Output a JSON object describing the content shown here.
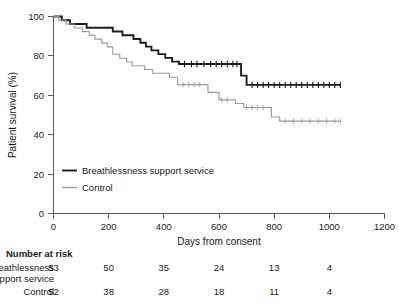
{
  "chart_data": {
    "type": "line",
    "title": "",
    "xlabel": "Days from consent",
    "ylabel": "Patient survival (%)",
    "xlim": [
      0,
      1200
    ],
    "ylim": [
      0,
      100
    ],
    "xticks": [
      0,
      200,
      400,
      600,
      800,
      1000,
      1200
    ],
    "yticks": [
      0,
      20,
      40,
      60,
      80,
      100
    ],
    "grid": false,
    "legend_position": "lower-left-inside",
    "series": [
      {
        "name": "Breathlessness support service",
        "color": "#1c1c1c",
        "style": "step",
        "points": [
          [
            0,
            100
          ],
          [
            30,
            100
          ],
          [
            30,
            98.1
          ],
          [
            60,
            98.1
          ],
          [
            60,
            96.2
          ],
          [
            120,
            96.2
          ],
          [
            120,
            94.3
          ],
          [
            185,
            94.3
          ],
          [
            185,
            94.3
          ],
          [
            215,
            94.3
          ],
          [
            215,
            92.4
          ],
          [
            250,
            92.4
          ],
          [
            250,
            90.5
          ],
          [
            290,
            90.5
          ],
          [
            290,
            88.6
          ],
          [
            315,
            88.6
          ],
          [
            315,
            86.7
          ],
          [
            335,
            86.7
          ],
          [
            335,
            84.7
          ],
          [
            355,
            84.7
          ],
          [
            355,
            82.8
          ],
          [
            380,
            82.8
          ],
          [
            380,
            80.9
          ],
          [
            405,
            80.9
          ],
          [
            405,
            79.0
          ],
          [
            430,
            79.0
          ],
          [
            430,
            77.1
          ],
          [
            455,
            77.1
          ],
          [
            455,
            75.9
          ],
          [
            680,
            75.9
          ],
          [
            680,
            70.0
          ],
          [
            700,
            70.0
          ],
          [
            700,
            65.3
          ],
          [
            1040,
            65.3
          ]
        ],
        "censor_times": [
          475,
          500,
          520,
          545,
          570,
          590,
          610,
          630,
          650,
          665,
          720,
          740,
          760,
          780,
          800,
          820,
          840,
          860,
          880,
          900,
          920,
          940,
          960,
          980,
          1000,
          1020,
          1040
        ]
      },
      {
        "name": "Control",
        "color": "#9a9a9a",
        "style": "step",
        "points": [
          [
            0,
            100
          ],
          [
            20,
            100
          ],
          [
            20,
            98.1
          ],
          [
            45,
            98.1
          ],
          [
            45,
            96.2
          ],
          [
            75,
            96.2
          ],
          [
            75,
            94.2
          ],
          [
            105,
            94.2
          ],
          [
            105,
            92.3
          ],
          [
            130,
            92.3
          ],
          [
            130,
            90.4
          ],
          [
            150,
            90.4
          ],
          [
            150,
            88.5
          ],
          [
            175,
            88.5
          ],
          [
            175,
            86.5
          ],
          [
            195,
            86.5
          ],
          [
            195,
            84.6
          ],
          [
            215,
            84.6
          ],
          [
            215,
            80.8
          ],
          [
            240,
            80.8
          ],
          [
            240,
            78.8
          ],
          [
            265,
            78.8
          ],
          [
            265,
            76.9
          ],
          [
            285,
            76.9
          ],
          [
            285,
            75.0
          ],
          [
            330,
            75.0
          ],
          [
            330,
            73.1
          ],
          [
            360,
            73.1
          ],
          [
            360,
            71.2
          ],
          [
            420,
            71.2
          ],
          [
            420,
            69.2
          ],
          [
            450,
            69.2
          ],
          [
            450,
            65.4
          ],
          [
            560,
            65.4
          ],
          [
            560,
            61.5
          ],
          [
            600,
            61.5
          ],
          [
            600,
            57.7
          ],
          [
            660,
            57.7
          ],
          [
            660,
            55.8
          ],
          [
            690,
            55.8
          ],
          [
            690,
            53.8
          ],
          [
            790,
            53.8
          ],
          [
            790,
            49.0
          ],
          [
            820,
            49.0
          ],
          [
            820,
            46.9
          ],
          [
            1040,
            46.9
          ]
        ],
        "censor_times": [
          470,
          490,
          510,
          530,
          610,
          630,
          700,
          720,
          740,
          760,
          840,
          870,
          900,
          930,
          960,
          990,
          1020,
          1040
        ]
      }
    ]
  },
  "axis": {
    "y_label": "Patient survival (%)",
    "x_label": "Days from consent",
    "y_ticks": [
      "0",
      "20",
      "40",
      "60",
      "80",
      "100"
    ],
    "x_ticks": [
      "0",
      "200",
      "400",
      "600",
      "800",
      "1000",
      "1200"
    ]
  },
  "legend": {
    "items": [
      {
        "label": "Breathlessness support service",
        "color": "#1c1c1c"
      },
      {
        "label": "Control",
        "color": "#9a9a9a"
      }
    ]
  },
  "risk_table": {
    "title": "Number at risk",
    "rows": [
      {
        "label_line1": "Breathlessness",
        "label_line2": "support service",
        "values": [
          "53",
          "50",
          "35",
          "24",
          "13",
          "4"
        ]
      },
      {
        "label_line1": "Control",
        "label_line2": "",
        "values": [
          "52",
          "38",
          "28",
          "18",
          "11",
          "4"
        ]
      }
    ]
  }
}
